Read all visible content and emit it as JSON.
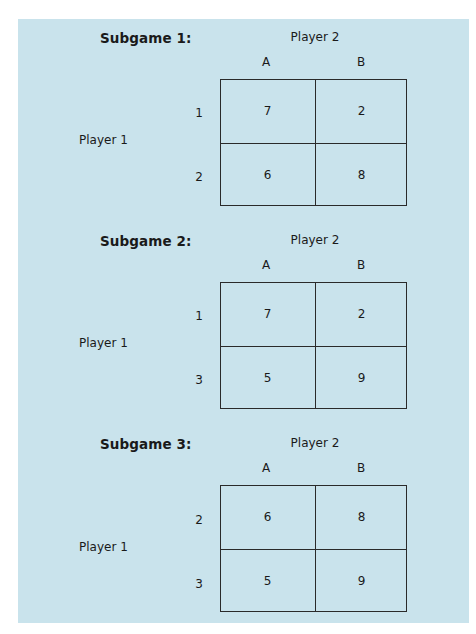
{
  "subgames": [
    {
      "title": "Subgame 1:",
      "column_player": "Player 2",
      "row_player": "Player 1",
      "columns": [
        "A",
        "B"
      ],
      "rows": [
        "1",
        "2"
      ],
      "payoffs": [
        [
          "7",
          "2"
        ],
        [
          "6",
          "8"
        ]
      ]
    },
    {
      "title": "Subgame 2:",
      "column_player": "Player 2",
      "row_player": "Player 1",
      "columns": [
        "A",
        "B"
      ],
      "rows": [
        "1",
        "3"
      ],
      "payoffs": [
        [
          "7",
          "2"
        ],
        [
          "5",
          "9"
        ]
      ]
    },
    {
      "title": "Subgame 3:",
      "column_player": "Player 2",
      "row_player": "Player 1",
      "columns": [
        "A",
        "B"
      ],
      "rows": [
        "2",
        "3"
      ],
      "payoffs": [
        [
          "6",
          "8"
        ],
        [
          "5",
          "9"
        ]
      ]
    }
  ],
  "colors": {
    "panel_background": "#c9e3ec",
    "text": "#1a1a1a",
    "grid_line": "#2a2a2a"
  }
}
